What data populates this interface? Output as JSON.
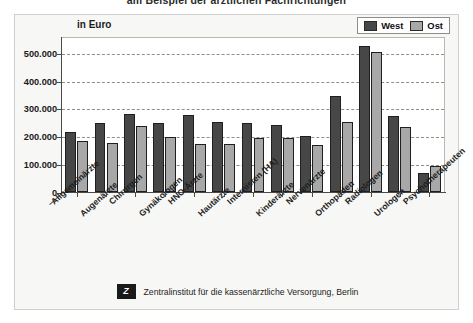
{
  "document": {
    "title": "am Beispiel der ärztlichen Fachrichtungen"
  },
  "figure": {
    "unit_label": "in Euro",
    "legend": [
      {
        "label": "West",
        "color": "#474747"
      },
      {
        "label": "Ost",
        "color": "#a8a8a8"
      }
    ],
    "footer": {
      "logo_glyph": "Z",
      "logo_name": "zi-logo",
      "text": "Zentralinstitut für die kassenärztliche Versorgung, Berlin"
    }
  },
  "chart_data": {
    "type": "bar",
    "title": "am Beispiel der ärztlichen Fachrichtungen",
    "xlabel": "",
    "ylabel": "in Euro",
    "ylim": [
      0,
      560000
    ],
    "yticks": [
      0,
      100000,
      200000,
      300000,
      400000,
      500000
    ],
    "ytick_labels": [
      "0",
      "100.000",
      "200.000",
      "300.000",
      "400.000",
      "500.000"
    ],
    "grid": true,
    "legend_position": "top-right",
    "categories": [
      "Allgemeinärzte",
      "Augenärzte",
      "Chirurgen",
      "Gynäkologen",
      "HNO-Ärzte",
      "Hautärzte",
      "Internisten (HA)",
      "Kinderärzte",
      "Nervenärzte",
      "Orthopäden",
      "Radiologen",
      "Urologen",
      "Psychotherapeuten"
    ],
    "series": [
      {
        "name": "West",
        "color": "#474747",
        "values": [
          220000,
          250000,
          285000,
          250000,
          280000,
          255000,
          250000,
          245000,
          205000,
          350000,
          530000,
          275000,
          70000
        ]
      },
      {
        "name": "Ost",
        "color": "#a8a8a8",
        "values": [
          185000,
          180000,
          240000,
          200000,
          175000,
          175000,
          195000,
          195000,
          170000,
          255000,
          510000,
          235000,
          95000
        ]
      }
    ]
  }
}
